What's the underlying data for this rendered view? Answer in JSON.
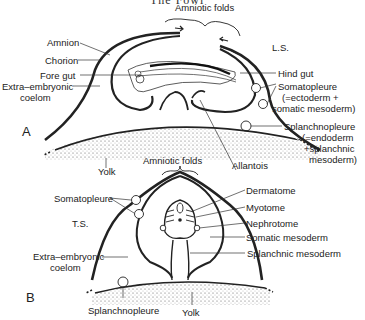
{
  "header": {
    "title": "The Fowl"
  },
  "panelA": {
    "letter": "A",
    "section": "L.S.",
    "labels": {
      "amniotic_folds": "Amniotic folds",
      "amnion": "Amnion",
      "chorion": "Chorion",
      "fore_gut": "Fore gut",
      "extra_coelom_1": "Extra–embryonic",
      "extra_coelom_2": "coelom",
      "hind_gut": "Hind gut",
      "somatopleure_1": "Somatopleure",
      "somatopleure_2": "(=ectoderm +",
      "somatopleure_3": "somatic mesoderm)",
      "splanchnopleure_1": "Splanchnopleure",
      "splanchnopleure_2": "(=endoderm",
      "splanchnopleure_3": "+splanchnic",
      "splanchnopleure_4": "mesoderm)",
      "yolk": "Yolk",
      "allantois": "Allantois"
    }
  },
  "panelB": {
    "letter": "B",
    "section": "T.S.",
    "labels": {
      "amniotic_folds": "Amniotic folds",
      "somatopleure": "Somatopleure",
      "extra_coelom_1": "Extra–embryonic",
      "extra_coelom_2": "coelom",
      "dermatome": "Dermatome",
      "myotome": "Myotome",
      "nephrotome": "Nephrotome",
      "somatic_mesoderm": "Somatic mesoderm",
      "splanchnic_mesoderm": "Splanchnic mesoderm",
      "splanchnopleure": "Splanchnopleure",
      "yolk": "Yolk"
    }
  }
}
